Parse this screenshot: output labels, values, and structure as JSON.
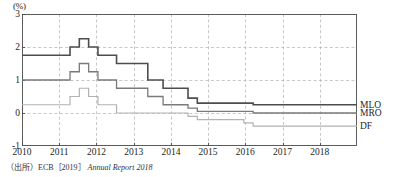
{
  "chart_data": {
    "type": "line",
    "title": "",
    "subtitle": "",
    "xlabel": "",
    "ylabel": "",
    "yunit": "(%)",
    "xlim": [
      2010.0,
      2019.0
    ],
    "ylim": [
      -1,
      3
    ],
    "yticks": [
      "3",
      "2",
      "1",
      "0",
      "-1"
    ],
    "ytick_values": [
      3,
      2,
      1,
      0,
      -1
    ],
    "xticks": [
      "2010",
      "2011",
      "2012",
      "2013",
      "2014",
      "2015",
      "2016",
      "2017",
      "2018"
    ],
    "xtick_values": [
      2010,
      2011,
      2012,
      2013,
      2014,
      2015,
      2016,
      2017,
      2018
    ],
    "grid": "dashed",
    "grid_x": true,
    "grid_y": true,
    "legend_position": "right",
    "drawstyle": "steps-post",
    "series": [
      {
        "name": "MLO",
        "color": "#4d4d4d",
        "width": 1.6,
        "x": [
          2010.0,
          2011.29,
          2011.54,
          2011.79,
          2012.04,
          2012.54,
          2013.38,
          2013.79,
          2014.46,
          2014.71,
          2016.21,
          2019.0
        ],
        "values": [
          1.75,
          2.0,
          2.25,
          2.0,
          1.75,
          1.5,
          1.0,
          0.75,
          0.45,
          0.3,
          0.25,
          0.25
        ]
      },
      {
        "name": "MRO",
        "color": "#7a7a7a",
        "width": 1.3,
        "x": [
          2010.0,
          2011.29,
          2011.54,
          2011.79,
          2012.04,
          2012.54,
          2013.38,
          2013.79,
          2014.46,
          2014.71,
          2016.21,
          2019.0
        ],
        "values": [
          1.0,
          1.25,
          1.5,
          1.25,
          1.0,
          0.75,
          0.5,
          0.25,
          0.15,
          0.05,
          0.0,
          0.0
        ]
      },
      {
        "name": "DF",
        "color": "#b3b3b3",
        "width": 1.2,
        "x": [
          2010.0,
          2011.29,
          2011.54,
          2011.79,
          2012.04,
          2012.54,
          2013.38,
          2014.46,
          2014.71,
          2015.96,
          2016.21,
          2019.0
        ],
        "values": [
          0.25,
          0.5,
          0.75,
          0.5,
          0.25,
          0.0,
          0.0,
          -0.1,
          -0.2,
          -0.3,
          -0.4,
          -0.4
        ]
      }
    ]
  },
  "legend": {
    "entries": [
      {
        "label": "MLO"
      },
      {
        "label": "MRO"
      },
      {
        "label": "DF"
      }
    ]
  },
  "source": {
    "label": "（出所）",
    "body": "ECB［2019］",
    "title": "Annual Report 2018"
  },
  "colors": {
    "axis": "#4a4a4a",
    "grid": "#b0b0b0",
    "mlo": "#4d4d4d",
    "mro": "#7a7a7a",
    "df": "#b3b3b3",
    "text": "#262626"
  }
}
